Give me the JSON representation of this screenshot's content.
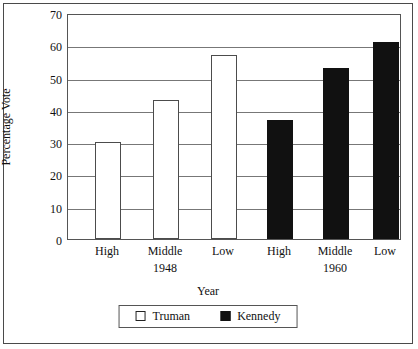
{
  "chart_data": {
    "type": "bar",
    "title": "",
    "xlabel": "Year",
    "ylabel": "Percentage Vote",
    "ylim": [
      0,
      70
    ],
    "ytick_step": 10,
    "yticks": [
      0,
      10,
      20,
      30,
      40,
      50,
      60,
      70
    ],
    "grid": true,
    "legend_position": "bottom",
    "categories": [
      "High",
      "Middle",
      "Low"
    ],
    "groups": [
      {
        "group_label": "1948",
        "series_name": "Truman",
        "style": "open",
        "categories": [
          "High",
          "Middle",
          "Low"
        ],
        "values": [
          30,
          43,
          57
        ]
      },
      {
        "group_label": "1960",
        "series_name": "Kennedy",
        "style": "filled",
        "categories": [
          "High",
          "Middle",
          "Low"
        ],
        "values": [
          37,
          53,
          61
        ]
      }
    ],
    "series": [
      {
        "name": "Truman",
        "values": [
          30,
          43,
          57
        ]
      },
      {
        "name": "Kennedy",
        "values": [
          37,
          53,
          61
        ]
      }
    ],
    "legend": [
      {
        "label": "Truman",
        "swatch": "open",
        "color": "#ffffff"
      },
      {
        "label": "Kennedy",
        "swatch": "filled",
        "color": "#111111"
      }
    ],
    "colors": {
      "truman_fill": "#ffffff",
      "truman_stroke": "#4c4c4c",
      "kennedy_fill": "#111111",
      "axis": "#555555",
      "grid": "#777777",
      "background": "#ffffff"
    }
  }
}
